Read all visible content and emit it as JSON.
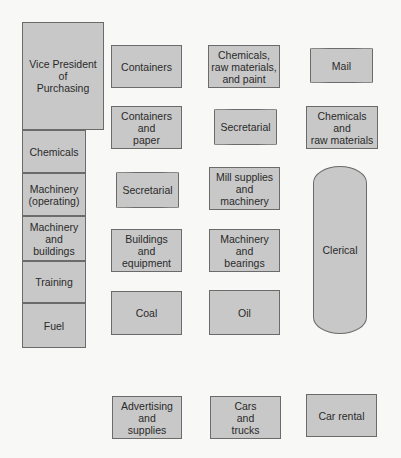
{
  "diagram": {
    "type": "organization-layout",
    "nodes": [
      {
        "id": "vp",
        "label": "Vice President\nof\nPurchasing",
        "shape": "rect",
        "x": 22,
        "y": 22,
        "w": 82,
        "h": 108
      },
      {
        "id": "chemicals",
        "label": "Chemicals",
        "shape": "rect",
        "x": 22,
        "y": 130,
        "w": 64,
        "h": 43
      },
      {
        "id": "machinery-operating",
        "label": "Machinery\n(operating)",
        "shape": "rect",
        "x": 22,
        "y": 173,
        "w": 64,
        "h": 43
      },
      {
        "id": "machinery-buildings",
        "label": "Machinery\nand\nbuildings",
        "shape": "rect",
        "x": 22,
        "y": 216,
        "w": 64,
        "h": 45
      },
      {
        "id": "training",
        "label": "Training",
        "shape": "rect",
        "x": 22,
        "y": 261,
        "w": 64,
        "h": 42
      },
      {
        "id": "fuel",
        "label": "Fuel",
        "shape": "rect",
        "x": 22,
        "y": 303,
        "w": 64,
        "h": 45
      },
      {
        "id": "containers",
        "label": "Containers",
        "shape": "rect",
        "x": 111,
        "y": 45,
        "w": 71,
        "h": 43
      },
      {
        "id": "containers-paper",
        "label": "Containers\nand\npaper",
        "shape": "rect",
        "x": 111,
        "y": 106,
        "w": 71,
        "h": 43
      },
      {
        "id": "secretarial-1",
        "label": "Secretarial",
        "shape": "pill",
        "x": 116,
        "y": 172,
        "w": 63,
        "h": 36
      },
      {
        "id": "buildings-equipment",
        "label": "Buildings\nand\nequipment",
        "shape": "rect",
        "x": 111,
        "y": 229,
        "w": 71,
        "h": 43
      },
      {
        "id": "coal",
        "label": "Coal",
        "shape": "rect",
        "x": 111,
        "y": 291,
        "w": 71,
        "h": 44
      },
      {
        "id": "chem-raw-paint",
        "label": "Chemicals,\nraw materials,\nand paint",
        "shape": "rect",
        "x": 208,
        "y": 45,
        "w": 72,
        "h": 43
      },
      {
        "id": "secretarial-2",
        "label": "Secretarial",
        "shape": "pill",
        "x": 214,
        "y": 109,
        "w": 63,
        "h": 36
      },
      {
        "id": "mill-supplies",
        "label": "Mill supplies\nand\nmachinery",
        "shape": "rect",
        "x": 209,
        "y": 167,
        "w": 71,
        "h": 43
      },
      {
        "id": "machinery-bearings",
        "label": "Machinery\nand\nbearings",
        "shape": "rect",
        "x": 209,
        "y": 229,
        "w": 71,
        "h": 43
      },
      {
        "id": "oil",
        "label": "Oil",
        "shape": "rect",
        "x": 209,
        "y": 290,
        "w": 71,
        "h": 45
      },
      {
        "id": "mail",
        "label": "Mail",
        "shape": "pill",
        "x": 310,
        "y": 48,
        "w": 63,
        "h": 35
      },
      {
        "id": "chem-raw",
        "label": "Chemicals\nand\nraw materials",
        "shape": "rect",
        "x": 306,
        "y": 106,
        "w": 72,
        "h": 43
      },
      {
        "id": "clerical",
        "label": "Clerical",
        "shape": "capsule-v",
        "x": 313,
        "y": 166,
        "w": 54,
        "h": 168
      },
      {
        "id": "advertising",
        "label": "Advertising\nand\nsupplies",
        "shape": "rect",
        "x": 112,
        "y": 396,
        "w": 70,
        "h": 43
      },
      {
        "id": "cars-trucks",
        "label": "Cars\nand\ntrucks",
        "shape": "rect",
        "x": 210,
        "y": 396,
        "w": 71,
        "h": 43
      },
      {
        "id": "car-rental",
        "label": "Car rental",
        "shape": "rect",
        "x": 306,
        "y": 394,
        "w": 71,
        "h": 43
      }
    ]
  },
  "colors": {
    "background": "#f8f8f6",
    "node_fill": "#c8c8c8",
    "node_border": "#6b6b6b",
    "text": "#2a2a2a"
  }
}
